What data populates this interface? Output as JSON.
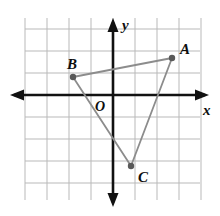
{
  "figure": {
    "background_color": "#ffffff",
    "width": 220,
    "height": 216
  },
  "axes": {
    "x_label": "x",
    "y_label": "y",
    "origin_label": "O",
    "axis_color": "#111111",
    "grid_color": "#b9b9b9",
    "origin_px": {
      "x": 113,
      "y": 95
    },
    "grid_spacing_px": 22,
    "x_range_units": [
      -5,
      5
    ],
    "y_range_units": [
      -5,
      3
    ],
    "grid": true,
    "arrows": [
      "left",
      "right",
      "up",
      "down"
    ]
  },
  "chart_data": {
    "type": "scatter",
    "xlabel": "x",
    "ylabel": "y",
    "xlim": [
      -5,
      5
    ],
    "ylim": [
      -5,
      3
    ],
    "grid": true,
    "legend": "none",
    "shape": "triangle",
    "shape_edges": [
      [
        "A",
        "B"
      ],
      [
        "B",
        "C"
      ],
      [
        "C",
        "A"
      ]
    ],
    "shape_color": "#8c8c8c",
    "vertex_color": "#595959",
    "points": [
      {
        "label": "A",
        "x": 3,
        "y": 2,
        "px": 172,
        "py": 58,
        "label_dx": 8,
        "label_dy": -16
      },
      {
        "label": "B",
        "x": -2,
        "y": 1,
        "px": 73,
        "py": 77,
        "label_dx": -6,
        "label_dy": -20
      },
      {
        "label": "C",
        "x": 1,
        "y": -3,
        "px": 131,
        "py": 166,
        "label_dx": 7,
        "label_dy": 4
      }
    ]
  }
}
